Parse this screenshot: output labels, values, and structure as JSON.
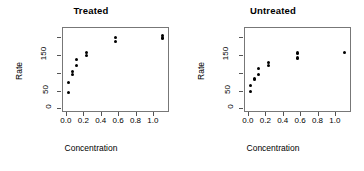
{
  "figure": {
    "background_color": "#ffffff",
    "point_color": "#000000",
    "axis_color": "#777777"
  },
  "chart_data": [
    {
      "type": "scatter",
      "title": "Treated",
      "xlabel": "Concentration",
      "ylabel": "Rate",
      "xlim": [
        -0.045,
        1.185
      ],
      "ylim": [
        -10,
        228
      ],
      "xticks": [
        0.0,
        0.2,
        0.4,
        0.6,
        0.8,
        1.0
      ],
      "xticklabels": [
        "0.0",
        "0.2",
        "0.4",
        "0.6",
        "0.8",
        "1.0"
      ],
      "yticks": [
        0,
        50,
        100,
        150,
        200
      ],
      "yticklabels": [
        "0",
        "50",
        "",
        "150",
        ""
      ],
      "grid": false,
      "legend": "none",
      "x": [
        0.02,
        0.02,
        0.06,
        0.06,
        0.11,
        0.11,
        0.22,
        0.22,
        0.56,
        0.56,
        1.1,
        1.1
      ],
      "y": [
        76,
        47,
        97,
        107,
        123,
        139,
        159,
        152,
        191,
        201,
        207,
        200
      ]
    },
    {
      "type": "scatter",
      "title": "Untreated",
      "xlabel": "Concentration",
      "ylabel": "Rate",
      "xlim": [
        -0.045,
        1.185
      ],
      "ylim": [
        -10,
        228
      ],
      "xticks": [
        0.0,
        0.2,
        0.4,
        0.6,
        0.8,
        1.0
      ],
      "xticklabels": [
        "0.0",
        "0.2",
        "0.4",
        "0.6",
        "0.8",
        "1.0"
      ],
      "yticks": [
        0,
        50,
        100,
        150,
        200
      ],
      "yticklabels": [
        "0",
        "50",
        "",
        "150",
        ""
      ],
      "grid": false,
      "legend": "none",
      "x": [
        0.02,
        0.02,
        0.06,
        0.06,
        0.11,
        0.11,
        0.22,
        0.22,
        0.56,
        0.56,
        1.1
      ],
      "y": [
        67,
        51,
        84,
        86,
        98,
        115,
        131,
        124,
        144,
        158,
        160
      ]
    }
  ]
}
